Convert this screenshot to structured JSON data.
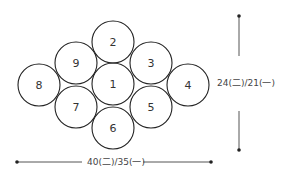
{
  "diagram": {
    "circles": [
      {
        "label": "1",
        "cx": 113,
        "cy": 84
      },
      {
        "label": "2",
        "cx": 113,
        "cy": 42
      },
      {
        "label": "3",
        "cx": 151,
        "cy": 63
      },
      {
        "label": "4",
        "cx": 188,
        "cy": 85
      },
      {
        "label": "5",
        "cx": 151,
        "cy": 107
      },
      {
        "label": "6",
        "cx": 113,
        "cy": 128
      },
      {
        "label": "7",
        "cx": 76,
        "cy": 107
      },
      {
        "label": "8",
        "cx": 39,
        "cy": 85
      },
      {
        "label": "9",
        "cx": 76,
        "cy": 63
      }
    ],
    "radius": 21,
    "height_label": "24(二)/21(一)",
    "width_label": "40(二)/35(一)",
    "stroke_color": "#222222"
  }
}
